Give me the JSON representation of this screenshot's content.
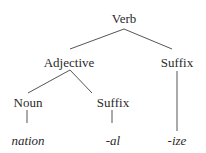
{
  "diagram": {
    "type": "morphological-tree",
    "nodes": [
      {
        "id": "verb",
        "label": "Verb",
        "x": 124,
        "y": 12,
        "italic": false
      },
      {
        "id": "adjective",
        "label": "Adjective",
        "x": 69,
        "y": 56,
        "italic": false
      },
      {
        "id": "suffix-ize-node",
        "label": "Suffix",
        "x": 177,
        "y": 56,
        "italic": false
      },
      {
        "id": "noun",
        "label": "Noun",
        "x": 28,
        "y": 96,
        "italic": false
      },
      {
        "id": "suffix-al-node",
        "label": "Suffix",
        "x": 113,
        "y": 96,
        "italic": false
      },
      {
        "id": "nation",
        "label": "nation",
        "x": 28,
        "y": 134,
        "italic": true
      },
      {
        "id": "al",
        "label": "-al",
        "x": 113,
        "y": 134,
        "italic": true
      },
      {
        "id": "ize",
        "label": "-ize",
        "x": 177,
        "y": 134,
        "italic": true
      }
    ],
    "edges": [
      {
        "from": "verb",
        "to": "adjective",
        "x1": 124,
        "y1": 29,
        "x2": 70,
        "y2": 49
      },
      {
        "from": "verb",
        "to": "suffix-ize-node",
        "x1": 124,
        "y1": 29,
        "x2": 172,
        "y2": 49
      },
      {
        "from": "adjective",
        "to": "noun",
        "x1": 70,
        "y1": 70,
        "x2": 28,
        "y2": 93
      },
      {
        "from": "adjective",
        "to": "suffix-al-node",
        "x1": 70,
        "y1": 70,
        "x2": 92,
        "y2": 93
      },
      {
        "from": "noun",
        "to": "nation",
        "x1": 27,
        "y1": 110,
        "x2": 27,
        "y2": 123
      },
      {
        "from": "suffix-al-node",
        "to": "al",
        "x1": 112,
        "y1": 110,
        "x2": 112,
        "y2": 123
      },
      {
        "from": "suffix-ize-node",
        "to": "ize",
        "x1": 177,
        "y1": 71,
        "x2": 177,
        "y2": 131
      }
    ]
  }
}
